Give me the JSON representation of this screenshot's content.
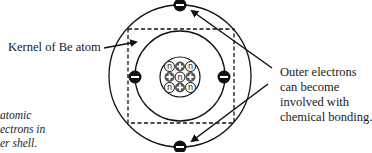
{
  "diagram": {
    "kernel_label": "Kernel of Be atom",
    "outer_label": [
      "Outer electrons",
      "can become",
      "involved with",
      "chemical bonding."
    ],
    "caption_fragment": [
      "atomic",
      "ectrons in",
      "er shell."
    ],
    "nucleus": {
      "rows": [
        [
          "n",
          "+",
          "n"
        ],
        [
          "+",
          "n",
          "+"
        ],
        [
          "n",
          "+",
          "n"
        ]
      ],
      "proton_symbol": "+",
      "neutron_symbol": "n"
    },
    "electrons": {
      "inner_shell_count": 2,
      "outer_shell_count": 2,
      "symbol": "−"
    },
    "colors": {
      "ink": "#111111",
      "background": "#ffffff"
    }
  }
}
